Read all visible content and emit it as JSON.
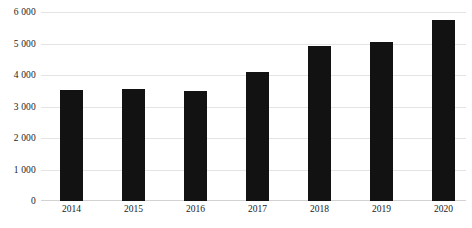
{
  "chart_data": {
    "type": "bar",
    "title": "",
    "subtitle": "",
    "xlabel": "",
    "ylabel": "",
    "categories": [
      "2014",
      "2015",
      "2016",
      "2017",
      "2018",
      "2019",
      "2020"
    ],
    "values": [
      3530,
      3580,
      3510,
      4110,
      4950,
      5080,
      5790
    ],
    "series": [
      {
        "name": "",
        "values": [
          3530,
          3580,
          3510,
          4110,
          4950,
          5080,
          5790
        ]
      }
    ],
    "ylim": [
      0,
      6000
    ],
    "y_ticks": [
      0,
      1000,
      2000,
      3000,
      4000,
      5000,
      6000
    ],
    "y_tick_labels": [
      "0",
      "1 000",
      "2 000",
      "3 000",
      "4 000",
      "5 000",
      "6 000"
    ],
    "grid": true,
    "legend": false,
    "legend_position": "none",
    "bar_color": "#121212",
    "gridline_color": "#e4e4e4",
    "axis_color": "#d2d2d2",
    "background_color": "#ffffff"
  }
}
